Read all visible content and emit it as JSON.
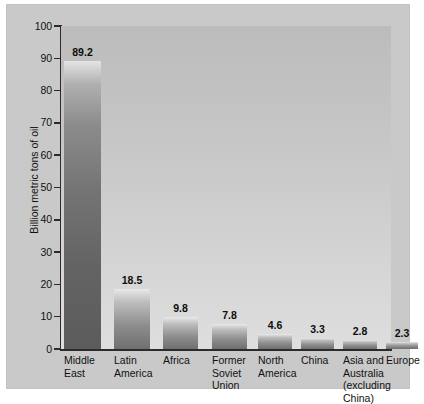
{
  "chart_data": {
    "type": "bar",
    "title": "",
    "subtitle": "",
    "xlabel": "",
    "ylabel": "Billion metric tons of oil",
    "ylim": [
      0,
      100
    ],
    "yticks": [
      0,
      10,
      20,
      30,
      40,
      50,
      60,
      70,
      80,
      90,
      100
    ],
    "ytick_labels": [
      "0",
      "10",
      "20",
      "30",
      "40",
      "50",
      "60",
      "70",
      "80",
      "90",
      "100"
    ],
    "grid": false,
    "legend": null,
    "categories": [
      "Middle East",
      "Latin America",
      "Africa",
      "Former Soviet Union",
      "North America",
      "China",
      "Asia and Australia (excluding China)",
      "Europe"
    ],
    "category_label_lines": [
      [
        "Middle",
        "East"
      ],
      [
        "Latin",
        "America"
      ],
      [
        "Africa"
      ],
      [
        "Former",
        "Soviet",
        "Union"
      ],
      [
        "North",
        "America"
      ],
      [
        "China"
      ],
      [
        "Asia and",
        "Australia",
        "(excluding",
        "China)"
      ],
      [
        "Europe"
      ]
    ],
    "values": [
      89.2,
      18.5,
      9.8,
      7.8,
      4.6,
      3.3,
      2.8,
      2.3
    ],
    "value_labels": [
      "89.2",
      "18.5",
      "9.8",
      "7.8",
      "4.6",
      "3.3",
      "2.8",
      "2.3"
    ]
  },
  "colors": {
    "panel_background": "#c9c9c9",
    "plot_background_top": "#bcbcbc",
    "plot_background_bottom": "#dedede",
    "bar_light": "#e9e9e9",
    "bar_dark": "#5c5c5c",
    "axis": "#2b2b2b",
    "text": "#111111"
  }
}
